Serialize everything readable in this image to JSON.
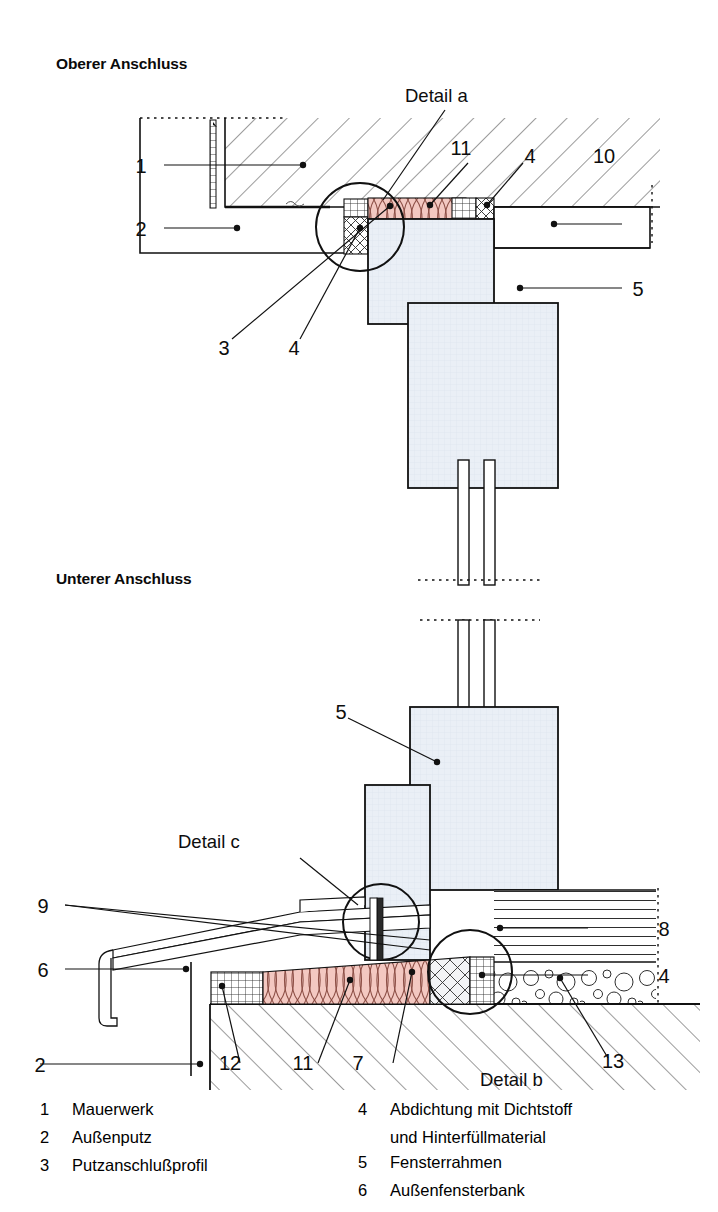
{
  "document": {
    "kind": "architectural-detail-drawing",
    "language": "de"
  },
  "sections": {
    "upper": {
      "title": "Oberer Anschluss"
    },
    "lower": {
      "title": "Unterer Anschluss"
    }
  },
  "detail_callouts": {
    "a": "Detail a",
    "b": "Detail b",
    "c": "Detail c"
  },
  "upper_labels": [
    {
      "id": "u1",
      "text": "1"
    },
    {
      "id": "u2",
      "text": "2"
    },
    {
      "id": "u3",
      "text": "3"
    },
    {
      "id": "u4a",
      "text": "4"
    },
    {
      "id": "u4b",
      "text": "4"
    },
    {
      "id": "u5",
      "text": "5"
    },
    {
      "id": "u10",
      "text": "10"
    },
    {
      "id": "u11",
      "text": "11"
    }
  ],
  "lower_labels": [
    {
      "id": "l2",
      "text": "2"
    },
    {
      "id": "l4",
      "text": "4"
    },
    {
      "id": "l5",
      "text": "5"
    },
    {
      "id": "l6",
      "text": "6"
    },
    {
      "id": "l7",
      "text": "7"
    },
    {
      "id": "l8",
      "text": "8"
    },
    {
      "id": "l9",
      "text": "9"
    },
    {
      "id": "l11",
      "text": "11"
    },
    {
      "id": "l12",
      "text": "12"
    },
    {
      "id": "l13",
      "text": "13"
    }
  ],
  "legend": {
    "left": [
      {
        "num": "1",
        "text": "Mauerwerk"
      },
      {
        "num": "2",
        "text": "Außenputz"
      },
      {
        "num": "3",
        "text": "Putzanschlußprofil"
      }
    ],
    "right": [
      {
        "num": "4",
        "text": "Abdichtung mit Dichtstoff",
        "cont": "und Hinterfüllmaterial"
      },
      {
        "num": "5",
        "text": "Fensterrahmen"
      },
      {
        "num": "6",
        "text": "Außenfensterbank"
      }
    ]
  },
  "colors": {
    "line": "#111111",
    "hatch": "#3a3a3a",
    "insulation_fill": "#f3c8c1",
    "insulation_line": "#8d4f46",
    "frame_fill": "#e9eef5",
    "frame_line": "#7e93ae",
    "sealant_fill": "#c9ccd1",
    "white": "#ffffff"
  }
}
